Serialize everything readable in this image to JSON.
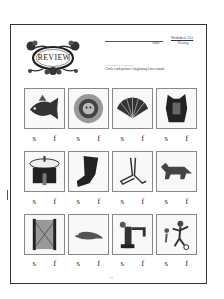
{
  "header": {
    "badge_title": "REVIEW",
    "name_label": "Name",
    "worksheet_title": "Worksheet 13A",
    "worksheet_subtitle": "Hearing"
  },
  "instructions": {
    "heading": "INSTRUCTIONS:",
    "text": "Circle each picture's beginning letter sound."
  },
  "choices": [
    "s",
    "f"
  ],
  "items": [
    {
      "picture": "fish",
      "choices": [
        "s",
        "f"
      ]
    },
    {
      "picture": "sun",
      "choices": [
        "s",
        "f"
      ]
    },
    {
      "picture": "fan",
      "choices": [
        "s",
        "f"
      ]
    },
    {
      "picture": "saddle",
      "choices": [
        "s",
        "f"
      ]
    },
    {
      "picture": "sink",
      "choices": [
        "s",
        "f"
      ]
    },
    {
      "picture": "sock",
      "choices": [
        "s",
        "f"
      ]
    },
    {
      "picture": "feet",
      "choices": [
        "s",
        "f"
      ]
    },
    {
      "picture": "fox",
      "choices": [
        "s",
        "f"
      ]
    },
    {
      "picture": "fence",
      "choices": [
        "s",
        "f"
      ]
    },
    {
      "picture": "seal",
      "choices": [
        "s",
        "f"
      ]
    },
    {
      "picture": "faucet",
      "choices": [
        "s",
        "f"
      ]
    },
    {
      "picture": "soccer",
      "choices": [
        "s",
        "f"
      ]
    }
  ],
  "footer": {
    "page_number": "42"
  }
}
